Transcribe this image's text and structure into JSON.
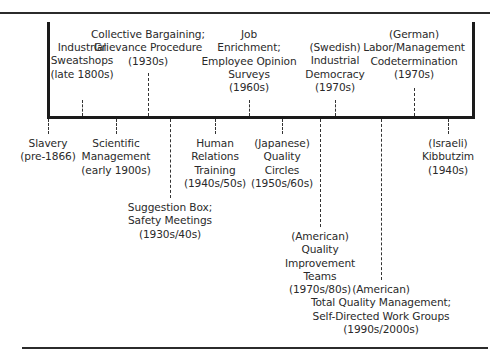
{
  "diagram": {
    "type": "timeline",
    "above": [
      {
        "id": "sweatshops",
        "x": 82,
        "top": 41,
        "dash_top": 100,
        "lines": [
          "Industrial",
          "Sweatshops",
          "(late 1800s)"
        ]
      },
      {
        "id": "collective-bargaining",
        "x": 148,
        "top": 28,
        "dash_top": 73,
        "lines": [
          "Collective Bargaining;",
          "Grievance Procedure",
          "(1930s)"
        ]
      },
      {
        "id": "job-enrichment",
        "x": 249,
        "top": 28,
        "dash_top": 100,
        "lines": [
          "Job",
          "Enrichment;",
          "Employee Opinion",
          "Surveys",
          "(1960s)"
        ]
      },
      {
        "id": "swedish-industrial-democracy",
        "x": 335,
        "top": 41,
        "dash_top": 100,
        "lines": [
          "(Swedish)",
          "Industrial",
          "Democracy",
          "(1970s)"
        ]
      },
      {
        "id": "german-codetermination",
        "x": 414,
        "top": 28,
        "dash_top": 88,
        "lines": [
          "(German)",
          "Labor/Management",
          "Codetermination",
          "(1970s)"
        ]
      }
    ],
    "below": [
      {
        "id": "slavery",
        "x": 48,
        "dash_bottom": 134,
        "top": 137,
        "lines": [
          "Slavery",
          "(pre-1866)"
        ]
      },
      {
        "id": "scientific-management",
        "x": 116,
        "dash_bottom": 134,
        "top": 137,
        "lines": [
          "Scientific",
          "Management",
          "(early 1900s)"
        ]
      },
      {
        "id": "suggestion-box",
        "x": 170,
        "dash_bottom": 198,
        "top": 201,
        "lines": [
          "Suggestion Box;",
          "Safety Meetings",
          "(1930s/40s)"
        ]
      },
      {
        "id": "human-relations",
        "x": 215,
        "dash_bottom": 134,
        "top": 137,
        "lines": [
          "Human",
          "Relations",
          "Training",
          "(1940s/50s)"
        ]
      },
      {
        "id": "japanese-quality-circles",
        "x": 282,
        "dash_bottom": 134,
        "top": 137,
        "lines": [
          "(Japanese)",
          "Quality",
          "Circles",
          "(1950s/60s)"
        ]
      },
      {
        "id": "american-quality-improvement",
        "x": 320,
        "dash_bottom": 227,
        "top": 230,
        "lines": [
          "(American)",
          "Quality",
          "Improvement",
          "Teams",
          "(1970s/80s)"
        ]
      },
      {
        "id": "american-tqm",
        "x": 381,
        "dash_bottom": 280,
        "top": 283,
        "lines": [
          "(American)",
          "Total Quality Management;",
          "Self-Directed Work Groups",
          "(1990s/2000s)"
        ]
      },
      {
        "id": "israeli-kibbutzim",
        "x": 448,
        "dash_bottom": 134,
        "top": 137,
        "lines": [
          "(Israeli)",
          "Kibbutzim",
          "(1940s)"
        ]
      }
    ]
  }
}
